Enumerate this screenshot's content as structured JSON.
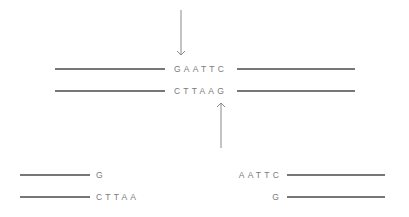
{
  "diagram": {
    "intact": {
      "top_strand": "GAATTC",
      "bottom_strand": "CTTAAG"
    },
    "cut_arrows": [
      {
        "name": "top-cut-arrow",
        "direction": "down",
        "strand": "top"
      },
      {
        "name": "bottom-cut-arrow",
        "direction": "up",
        "strand": "bottom"
      }
    ],
    "left_fragment": {
      "top_strand": "G",
      "bottom_strand": "CTTAA"
    },
    "right_fragment": {
      "top_strand": "AATTC",
      "bottom_strand": "G"
    },
    "colors": {
      "strand": "#4a4a4a",
      "arrow": "#8a8a8a",
      "text": "#7a7a7a"
    }
  }
}
